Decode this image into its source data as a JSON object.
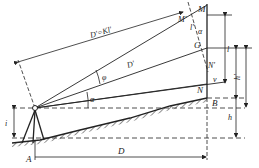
{
  "diagram": {
    "type": "surveying-stadia-inclined-sight",
    "labels": {
      "M": "M",
      "M_prime": "M'",
      "l_prime": "l'",
      "alpha_right": "α",
      "G": "G",
      "N_prime": "N'",
      "v": "v",
      "N": "N",
      "B": "B",
      "D_prime_eq": "D'=Kl'",
      "D_prime": "D'",
      "phi": "φ",
      "alpha": "α",
      "i": "i",
      "A": "A",
      "D": "D",
      "l": "l",
      "H_prime": "h'",
      "h": "h"
    },
    "colors": {
      "ink": "#222222",
      "background": "#ffffff"
    }
  }
}
